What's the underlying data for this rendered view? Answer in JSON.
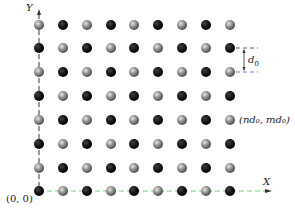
{
  "diagram": {
    "type": "2D checkerboard lattice of atoms",
    "grid": {
      "columns": 9,
      "rows": 8,
      "col_x": [
        39,
        63,
        87,
        111,
        134,
        158,
        182,
        206,
        230
      ],
      "row_y": [
        191,
        168,
        144,
        120,
        96,
        72,
        48,
        25
      ],
      "origin_atom": "dark",
      "colors": {
        "dark": "#151515",
        "light": "#8c8c8c"
      }
    },
    "axes": {
      "y_label": "Y",
      "x_label": "X",
      "origin_label": "(0, 0)",
      "y_axis_color": "#333333",
      "x_axis_color": "#6fcf6f"
    },
    "annotations": {
      "spacing_label": "d",
      "spacing_subscript": "0",
      "point_label": "(nd₀, md₀)"
    }
  }
}
